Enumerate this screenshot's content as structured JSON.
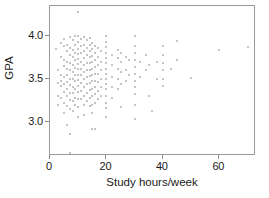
{
  "chart_data": {
    "type": "scatter",
    "title": "",
    "xlabel": "Study hours/week",
    "ylabel": "GPA",
    "xlim": [
      0,
      73
    ],
    "ylim": [
      2.6,
      4.35
    ],
    "grid": false,
    "legend": null,
    "xticks": [
      0,
      20,
      40,
      60
    ],
    "xticklabels": [
      "0",
      "20",
      "40",
      "60"
    ],
    "yticks": [
      3.0,
      3.5,
      4.0
    ],
    "yticklabels": [
      "3.0",
      "3.5",
      "4.0"
    ],
    "marker": "dot",
    "marker_color": "#b0b0b0",
    "frame_color": "#9a9a9a",
    "background": "#ffffff",
    "points": [
      [
        10,
        4.28
      ],
      [
        2,
        3.85
      ],
      [
        3,
        3.6
      ],
      [
        3,
        3.45
      ],
      [
        3,
        3.3
      ],
      [
        3,
        3.2
      ],
      [
        4,
        3.92
      ],
      [
        4,
        3.75
      ],
      [
        4,
        3.55
      ],
      [
        4,
        3.48
      ],
      [
        4,
        3.42
      ],
      [
        4,
        3.28
      ],
      [
        5,
        3.97
      ],
      [
        5,
        3.88
      ],
      [
        5,
        3.72
      ],
      [
        5,
        3.65
      ],
      [
        5,
        3.52
      ],
      [
        5,
        3.44
      ],
      [
        5,
        3.35
      ],
      [
        5,
        3.22
      ],
      [
        5,
        3.1
      ],
      [
        6,
        3.9
      ],
      [
        6,
        3.82
      ],
      [
        6,
        3.7
      ],
      [
        6,
        3.62
      ],
      [
        6,
        3.55
      ],
      [
        6,
        3.46
      ],
      [
        6,
        3.38
      ],
      [
        6,
        3.3
      ],
      [
        6,
        3.18
      ],
      [
        6,
        2.96
      ],
      [
        7,
        3.99
      ],
      [
        7,
        3.86
      ],
      [
        7,
        3.78
      ],
      [
        7,
        3.68
      ],
      [
        7,
        3.6
      ],
      [
        7,
        3.5
      ],
      [
        7,
        3.43
      ],
      [
        7,
        3.34
      ],
      [
        7,
        3.25
      ],
      [
        7,
        3.15
      ],
      [
        7,
        2.86
      ],
      [
        7,
        2.64
      ],
      [
        8,
        3.95
      ],
      [
        8,
        3.84
      ],
      [
        8,
        3.76
      ],
      [
        8,
        3.66
      ],
      [
        8,
        3.58
      ],
      [
        8,
        3.5
      ],
      [
        8,
        3.4
      ],
      [
        8,
        3.33
      ],
      [
        8,
        3.24
      ],
      [
        8,
        3.12
      ],
      [
        9,
        4.0
      ],
      [
        9,
        3.89
      ],
      [
        9,
        3.8
      ],
      [
        9,
        3.72
      ],
      [
        9,
        3.63
      ],
      [
        9,
        3.55
      ],
      [
        9,
        3.47
      ],
      [
        9,
        3.38
      ],
      [
        9,
        3.28
      ],
      [
        9,
        3.2
      ],
      [
        10,
        4.0
      ],
      [
        10,
        3.93
      ],
      [
        10,
        3.85
      ],
      [
        10,
        3.79
      ],
      [
        10,
        3.73
      ],
      [
        10,
        3.67
      ],
      [
        10,
        3.61
      ],
      [
        10,
        3.55
      ],
      [
        10,
        3.49
      ],
      [
        10,
        3.42
      ],
      [
        10,
        3.35
      ],
      [
        10,
        3.27
      ],
      [
        10,
        3.17
      ],
      [
        10,
        3.06
      ],
      [
        11,
        3.97
      ],
      [
        11,
        3.88
      ],
      [
        11,
        3.8
      ],
      [
        11,
        3.7
      ],
      [
        11,
        3.62
      ],
      [
        11,
        3.54
      ],
      [
        11,
        3.45
      ],
      [
        11,
        3.36
      ],
      [
        11,
        3.26
      ],
      [
        12,
        3.99
      ],
      [
        12,
        3.9
      ],
      [
        12,
        3.82
      ],
      [
        12,
        3.74
      ],
      [
        12,
        3.66
      ],
      [
        12,
        3.58
      ],
      [
        12,
        3.5
      ],
      [
        12,
        3.4
      ],
      [
        12,
        3.3
      ],
      [
        12,
        3.2
      ],
      [
        12,
        3.08
      ],
      [
        13,
        3.95
      ],
      [
        13,
        3.86
      ],
      [
        13,
        3.78
      ],
      [
        13,
        3.68
      ],
      [
        13,
        3.6
      ],
      [
        13,
        3.52
      ],
      [
        13,
        3.44
      ],
      [
        13,
        3.34
      ],
      [
        13,
        3.24
      ],
      [
        14,
        3.98
      ],
      [
        14,
        3.9
      ],
      [
        14,
        3.83
      ],
      [
        14,
        3.75
      ],
      [
        14,
        3.68
      ],
      [
        14,
        3.6
      ],
      [
        14,
        3.53
      ],
      [
        14,
        3.45
      ],
      [
        14,
        3.37
      ],
      [
        14,
        3.28
      ],
      [
        14,
        3.18
      ],
      [
        15,
        3.92
      ],
      [
        15,
        3.85
      ],
      [
        15,
        3.77
      ],
      [
        15,
        3.7
      ],
      [
        15,
        3.62
      ],
      [
        15,
        3.55
      ],
      [
        15,
        3.47
      ],
      [
        15,
        3.38
      ],
      [
        15,
        3.3
      ],
      [
        15,
        3.2
      ],
      [
        15,
        3.1
      ],
      [
        15,
        2.92
      ],
      [
        16,
        3.88
      ],
      [
        16,
        3.8
      ],
      [
        16,
        3.72
      ],
      [
        16,
        3.64
      ],
      [
        16,
        3.56
      ],
      [
        16,
        3.48
      ],
      [
        16,
        3.4
      ],
      [
        16,
        3.32
      ],
      [
        16,
        3.22
      ],
      [
        16,
        2.91
      ],
      [
        17,
        3.86
      ],
      [
        17,
        3.76
      ],
      [
        17,
        3.66
      ],
      [
        17,
        3.56
      ],
      [
        17,
        3.46
      ],
      [
        17,
        3.36
      ],
      [
        17,
        3.26
      ],
      [
        18,
        3.82
      ],
      [
        18,
        3.7
      ],
      [
        18,
        3.6
      ],
      [
        18,
        3.5
      ],
      [
        18,
        3.4
      ],
      [
        18,
        3.3
      ],
      [
        20,
        4.0
      ],
      [
        20,
        3.93
      ],
      [
        20,
        3.87
      ],
      [
        20,
        3.8
      ],
      [
        20,
        3.74
      ],
      [
        20,
        3.68
      ],
      [
        20,
        3.62
      ],
      [
        20,
        3.56
      ],
      [
        20,
        3.5
      ],
      [
        20,
        3.44
      ],
      [
        20,
        3.38
      ],
      [
        20,
        3.3
      ],
      [
        20,
        3.22
      ],
      [
        20,
        3.16
      ],
      [
        20,
        3.05
      ],
      [
        22,
        3.78
      ],
      [
        22,
        3.66
      ],
      [
        22,
        3.52
      ],
      [
        22,
        3.4
      ],
      [
        22,
        3.28
      ],
      [
        24,
        3.84
      ],
      [
        24,
        3.74
      ],
      [
        24,
        3.62
      ],
      [
        24,
        3.5
      ],
      [
        24,
        3.38
      ],
      [
        25,
        3.8
      ],
      [
        25,
        3.7
      ],
      [
        25,
        3.58
      ],
      [
        25,
        3.44
      ],
      [
        25,
        3.17
      ],
      [
        27,
        3.75
      ],
      [
        27,
        3.6
      ],
      [
        27,
        3.48
      ],
      [
        28,
        3.72
      ],
      [
        28,
        3.55
      ],
      [
        30,
        4.0
      ],
      [
        30,
        3.88
      ],
      [
        30,
        3.8
      ],
      [
        30,
        3.72
      ],
      [
        30,
        3.64
      ],
      [
        30,
        3.56
      ],
      [
        30,
        3.48
      ],
      [
        30,
        3.4
      ],
      [
        30,
        3.32
      ],
      [
        30,
        3.2
      ],
      [
        30,
        3.03
      ],
      [
        32,
        3.7
      ],
      [
        32,
        3.52
      ],
      [
        34,
        3.78
      ],
      [
        34,
        3.6
      ],
      [
        35,
        3.66
      ],
      [
        35,
        3.3
      ],
      [
        36,
        3.13
      ],
      [
        38,
        3.7
      ],
      [
        38,
        3.5
      ],
      [
        40,
        3.88
      ],
      [
        40,
        3.78
      ],
      [
        40,
        3.68
      ],
      [
        40,
        3.6
      ],
      [
        40,
        3.5
      ],
      [
        40,
        3.42
      ],
      [
        43,
        3.62
      ],
      [
        45,
        3.94
      ],
      [
        45,
        3.72
      ],
      [
        50,
        3.51
      ],
      [
        60,
        3.84
      ],
      [
        70,
        3.87
      ]
    ]
  },
  "axis": {
    "xlabel": "Study hours/week",
    "ylabel": "GPA"
  }
}
